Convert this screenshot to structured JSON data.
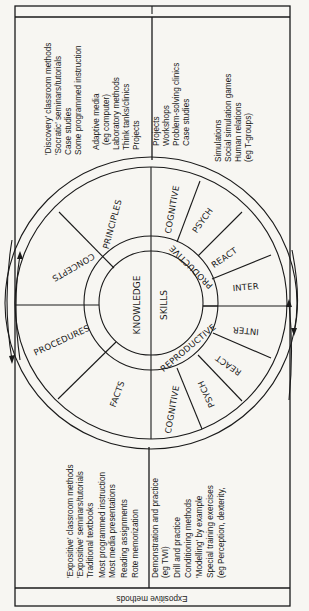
{
  "header": {
    "label": "Expositive methods"
  },
  "wheel": {
    "core": {
      "left": "KNOWLEDGE",
      "right": "SKILLS"
    },
    "inner_ring": {
      "upper": "PRODUCTIVE",
      "lower": "REPRODUCTIVE"
    },
    "knowledge_segments": [
      "PRINCIPLES",
      "CONCEPTS",
      "PROCEDURES",
      "FACTS"
    ],
    "productive_segments": [
      "COGNITIVE",
      "PSYCH",
      "REACT",
      "INTER"
    ],
    "reproductive_segments": [
      "INTER",
      "REACT",
      "PSYCH",
      "COGNITIVE"
    ]
  },
  "top_left_methods": [
    "'Discovery' classroom methods",
    "'Socratic' seminars/tutorials",
    "Case studies",
    "Some programmed instruction",
    "Adaptive media",
    "(eg computer)",
    "Laboratory methods",
    "Think tanks/clinics",
    "Projects"
  ],
  "top_right_methods": [
    "Projects",
    "Workshops",
    "Problem-solving clinics",
    "Case studies",
    "",
    "Simulations",
    "Social simulation games",
    "Human relations",
    "(eg T-groups)"
  ],
  "bottom_left_methods": [
    "'Expositive' classroom methods",
    "'Expositive' seminars/tutorials",
    "Traditional textbooks",
    "Most programmed instruction",
    "Most media presentations",
    "Reading assignments",
    "Rote memorization"
  ],
  "bottom_right_methods": [
    "Demonstration and practice",
    "(eg TWI)",
    "Drill and practice",
    "Conditioning methods",
    "'Modelling' by example",
    "Special training exercises",
    "(eg Perception, dexterity,"
  ],
  "arrows": {
    "left": "cycle-arrows-left",
    "right": "cycle-arrows-right"
  }
}
